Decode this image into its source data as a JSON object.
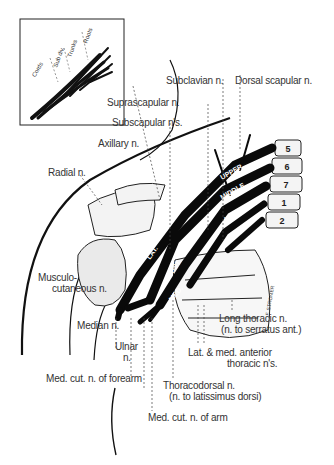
{
  "figure": {
    "type": "anatomical illustration",
    "inset": {
      "labels": [
        "Cords",
        "Sub div.",
        "Trunks",
        "Roots"
      ]
    },
    "vertebrae": [
      "5",
      "6",
      "7",
      "1",
      "2"
    ],
    "trunk_labels": [
      "UPPER",
      "MIDDLE",
      "LOWER"
    ],
    "cord_labels": [
      "LAT.",
      "POST.",
      "MED."
    ],
    "division_labels": [
      "A",
      "P",
      "A",
      "P",
      "A",
      "P"
    ],
    "artist_signature": "F. STROMER",
    "labels": {
      "subclavian": "Subclavian n.",
      "dorsal_scapular": "Dorsal scapular n.",
      "suprascapular": "Suprascapular n.",
      "subscapular": "Subscapular n's.",
      "axillary": "Axillary n.",
      "radial": "Radial n.",
      "musculocutaneous_1": "Musculo-",
      "musculocutaneous_2": "cutaneous n.",
      "median": "Median n.",
      "ulnar_1": "Ulnar",
      "ulnar_2": "n.",
      "med_cut_forearm": "Med. cut. n. of forearm",
      "med_cut_arm": "Med. cut. n. of arm",
      "thoracodorsal_1": "Thoracodorsal n.",
      "thoracodorsal_2": "(n. to latissimus dorsi)",
      "long_thoracic_1": "Long thoracic n.",
      "long_thoracic_2": "(n. to serratus ant.)",
      "anterior_thoracic_1": "Lat. & med. anterior",
      "anterior_thoracic_2": "thoracic n's."
    }
  }
}
